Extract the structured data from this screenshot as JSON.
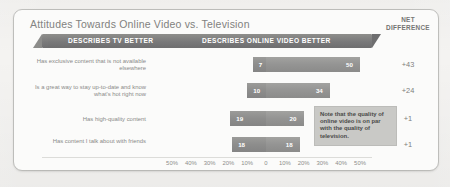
{
  "card": {
    "title": "Attitudes Towards Online Video vs. Television",
    "net_header_line1": "NET",
    "net_header_line2": "DIFFERENCE"
  },
  "banner": {
    "left_label": "DESCRIBES TV BETTER",
    "right_label": "DESCRIBES ONLINE VIDEO BETTER"
  },
  "note": {
    "text": "Note that the quality of online video is on par with the quality of television."
  },
  "axis": {
    "labels": [
      "50%",
      "40%",
      "30%",
      "20%",
      "10%",
      "0",
      "10%",
      "20%",
      "30%",
      "40%",
      "50%"
    ]
  },
  "rows": [
    {
      "label": "Has exclusive content that is not available elsewhere",
      "tv": 7,
      "online": 50,
      "tv_text": "7",
      "online_text": "50",
      "net": "+43"
    },
    {
      "label": "Is a great way to stay up-to-date and know what's hot right now",
      "tv": 10,
      "online": 34,
      "tv_text": "10",
      "online_text": "34",
      "net": "+24"
    },
    {
      "label": "Has high-quality content",
      "tv": 19,
      "online": 20,
      "tv_text": "19",
      "online_text": "20",
      "net": "+1"
    },
    {
      "label": "Has content I talk about with friends",
      "tv": 18,
      "online": 18,
      "tv_text": "18",
      "online_text": "18",
      "net": "+1"
    }
  ],
  "chart_data": {
    "type": "bar",
    "title": "Attitudes Towards Online Video vs. Television",
    "subtype": "diverging-horizontal-bar",
    "categories": [
      "Has exclusive content that is not available elsewhere",
      "Is a great way to stay up-to-date and know what's hot right now",
      "Has high-quality content",
      "Has content I talk about with friends"
    ],
    "series": [
      {
        "name": "DESCRIBES TV BETTER",
        "values": [
          7,
          10,
          19,
          18
        ]
      },
      {
        "name": "DESCRIBES ONLINE VIDEO BETTER",
        "values": [
          50,
          34,
          20,
          18
        ]
      }
    ],
    "net_difference": [
      "+43",
      "+24",
      "+1",
      "+1"
    ],
    "xlabel": "",
    "ylabel": "",
    "xlim": [
      -50,
      50
    ],
    "xticks": [
      "50%",
      "40%",
      "30%",
      "20%",
      "10%",
      "0",
      "10%",
      "20%",
      "30%",
      "40%",
      "50%"
    ],
    "grid": false,
    "legend_position": "top-banner",
    "annotations": [
      "Note that the quality of online video is on par with the quality of television."
    ]
  }
}
